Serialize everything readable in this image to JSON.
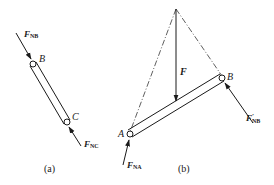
{
  "figure_a": {
    "caption": "(a)",
    "points": {
      "B": "B",
      "C": "C"
    },
    "forces": {
      "F_NB": {
        "main": "F",
        "sub": "NB"
      },
      "F_NC": {
        "main": "F",
        "sub": "NC"
      }
    }
  },
  "figure_b": {
    "caption": "(b)",
    "points": {
      "A": "A",
      "B": "B"
    },
    "forces": {
      "F": {
        "main": "F"
      },
      "F_NB_prime": {
        "main": "F",
        "prime": "′",
        "sub": "NB"
      },
      "F_NA": {
        "main": "F",
        "sub": "NA"
      }
    }
  },
  "colors": {
    "line": "#1a1a1a",
    "background": "#ffffff"
  }
}
